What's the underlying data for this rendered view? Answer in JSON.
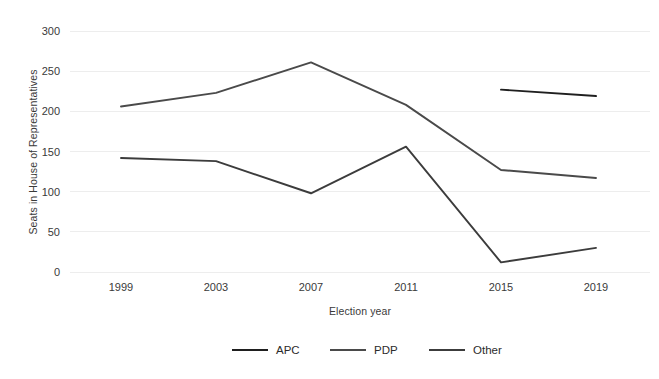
{
  "chart_data": {
    "type": "line",
    "title": "",
    "xlabel": "Election year",
    "ylabel": "Seats in House of Representatives",
    "categories": [
      "1999",
      "2003",
      "2007",
      "2011",
      "2015",
      "2019"
    ],
    "x": [
      1999,
      2003,
      2007,
      2011,
      2015,
      2019
    ],
    "ylim": [
      0,
      300
    ],
    "yticks": [
      0,
      50,
      100,
      150,
      200,
      250,
      300
    ],
    "ytick_labels": [
      "0",
      "50",
      "100",
      "150",
      "200",
      "250",
      "300"
    ],
    "grid": "horizontal",
    "legend_position": "bottom",
    "series": [
      {
        "name": "APC",
        "color": "#1f1f1f",
        "x": [
          2015,
          2019
        ],
        "values": [
          227,
          219
        ]
      },
      {
        "name": "PDP",
        "color": "#4a4a4a",
        "x": [
          1999,
          2003,
          2007,
          2011,
          2015,
          2019
        ],
        "values": [
          206,
          223,
          261,
          208,
          127,
          117
        ]
      },
      {
        "name": "Other",
        "color": "#3c3c3c",
        "x": [
          1999,
          2003,
          2007,
          2011,
          2015,
          2019
        ],
        "values": [
          142,
          138,
          98,
          156,
          12,
          30
        ]
      }
    ]
  },
  "legend": {
    "items": [
      {
        "label": "APC"
      },
      {
        "label": "PDP"
      },
      {
        "label": "Other"
      }
    ]
  },
  "colors": {
    "background": "#ffffff",
    "gridline": "#ededed",
    "text": "#2b2b2b",
    "apc": "#1f1f1f",
    "pdp": "#4a4a4a",
    "other": "#3c3c3c"
  }
}
